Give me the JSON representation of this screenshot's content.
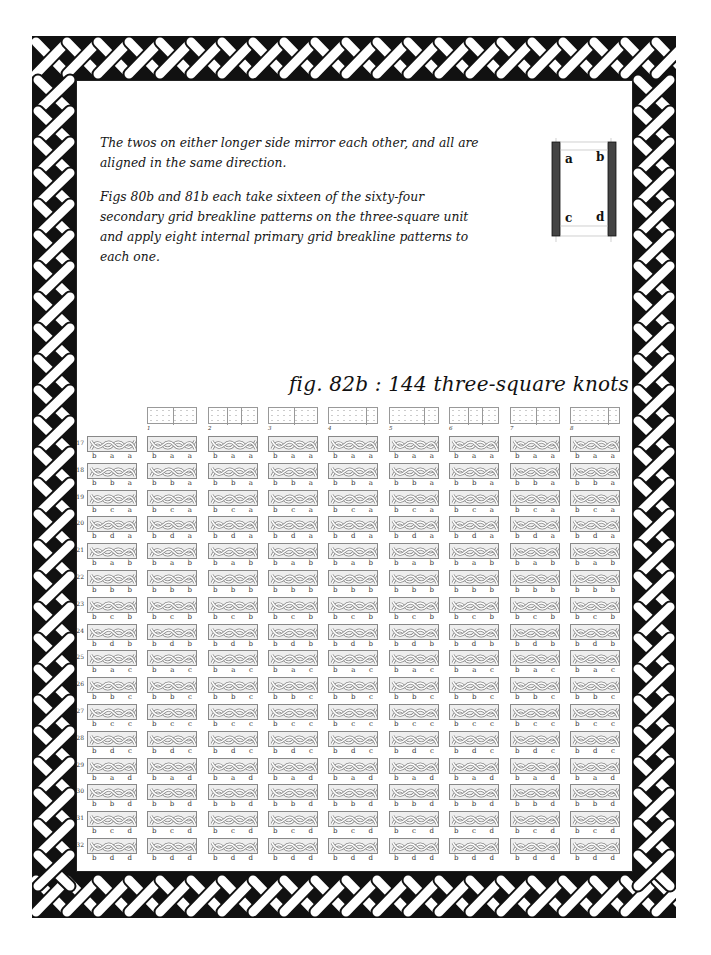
{
  "intro": {
    "paragraphs": [
      "The twos on either longer side mirror each other, and all are aligned in the same direction.",
      "Figs 80b and 81b each take sixteen of the sixty-four secondary grid breakline patterns on the three-square unit and apply eight internal primary grid breakline patterns to each one."
    ]
  },
  "diagram": {
    "labels": {
      "a": "a",
      "b": "b",
      "c": "c",
      "d": "d"
    }
  },
  "figure": {
    "title": "fig. 82b : 144 three-square knots",
    "columns": [
      "1",
      "2",
      "3",
      "4",
      "5",
      "6",
      "7",
      "8"
    ],
    "rows": [
      {
        "num": "17",
        "letters": [
          "b",
          "a",
          "a"
        ]
      },
      {
        "num": "18",
        "letters": [
          "b",
          "b",
          "a"
        ]
      },
      {
        "num": "19",
        "letters": [
          "b",
          "c",
          "a"
        ]
      },
      {
        "num": "20",
        "letters": [
          "b",
          "d",
          "a"
        ]
      },
      {
        "num": "21",
        "letters": [
          "b",
          "a",
          "b"
        ]
      },
      {
        "num": "22",
        "letters": [
          "b",
          "b",
          "b"
        ]
      },
      {
        "num": "23",
        "letters": [
          "b",
          "c",
          "b"
        ]
      },
      {
        "num": "24",
        "letters": [
          "b",
          "d",
          "b"
        ]
      },
      {
        "num": "25",
        "letters": [
          "b",
          "a",
          "c"
        ]
      },
      {
        "num": "26",
        "letters": [
          "b",
          "b",
          "c"
        ]
      },
      {
        "num": "27",
        "letters": [
          "b",
          "c",
          "c"
        ]
      },
      {
        "num": "28",
        "letters": [
          "b",
          "d",
          "c"
        ]
      },
      {
        "num": "29",
        "letters": [
          "b",
          "a",
          "d"
        ]
      },
      {
        "num": "30",
        "letters": [
          "b",
          "b",
          "d"
        ]
      },
      {
        "num": "31",
        "letters": [
          "b",
          "c",
          "d"
        ]
      },
      {
        "num": "32",
        "letters": [
          "b",
          "d",
          "d"
        ]
      }
    ]
  },
  "colors": {
    "ink": "#111111",
    "grid_gray": "#888888",
    "border_black": "#111111"
  }
}
